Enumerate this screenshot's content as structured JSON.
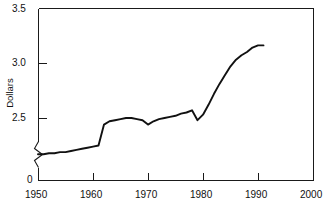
{
  "chart_data": {
    "type": "line",
    "title": "",
    "subtitle": "",
    "xlabel": "",
    "ylabel": "Dollars",
    "xlim": [
      1950,
      2000
    ],
    "ylim": [
      2.0,
      3.5
    ],
    "y_axis_break": true,
    "y_axis_break_note": "axis broken between 0 and ~2.0",
    "grid": false,
    "legend": null,
    "legend_position": "none",
    "x_ticks": [
      1950,
      1960,
      1970,
      1980,
      1990,
      2000
    ],
    "x_tick_labels": [
      "1950",
      "1960",
      "1970",
      "1980",
      "1990",
      "2000"
    ],
    "y_ticks": [
      0,
      2.5,
      3.0,
      3.5
    ],
    "y_tick_labels": [
      "0",
      "2.5",
      "3.0",
      "3.5"
    ],
    "series": [
      {
        "name": "Dollars",
        "color": "#111111",
        "x": [
          1950,
          1951,
          1952,
          1953,
          1954,
          1955,
          1956,
          1957,
          1958,
          1959,
          1960,
          1961,
          1962,
          1963,
          1964,
          1965,
          1966,
          1967,
          1968,
          1969,
          1970,
          1971,
          1972,
          1973,
          1974,
          1975,
          1976,
          1977,
          1978,
          1979,
          1980,
          1981,
          1982,
          1983,
          1984,
          1985,
          1986,
          1987,
          1988,
          1989,
          1990,
          1991
        ],
        "values": [
          2.17,
          2.17,
          2.18,
          2.18,
          2.19,
          2.19,
          2.2,
          2.21,
          2.22,
          2.23,
          2.24,
          2.25,
          2.44,
          2.47,
          2.48,
          2.49,
          2.5,
          2.5,
          2.49,
          2.48,
          2.44,
          2.47,
          2.49,
          2.5,
          2.51,
          2.52,
          2.54,
          2.55,
          2.57,
          2.48,
          2.53,
          2.62,
          2.72,
          2.81,
          2.89,
          2.97,
          3.03,
          3.07,
          3.1,
          3.14,
          3.16,
          3.16
        ]
      }
    ]
  },
  "axis": {
    "y_label": "Dollars",
    "y_tick_35": "3.5",
    "y_tick_30": "3.0",
    "y_tick_25": "2.5",
    "y_tick_0": "0",
    "x_tick_1950": "1950",
    "x_tick_1960": "1960",
    "x_tick_1970": "1970",
    "x_tick_1980": "1980",
    "x_tick_1990": "1990",
    "x_tick_2000": "2000"
  },
  "colors": {
    "line": "#111111",
    "axis": "#1a1a1a",
    "background": "#ffffff",
    "text": "#111111"
  }
}
